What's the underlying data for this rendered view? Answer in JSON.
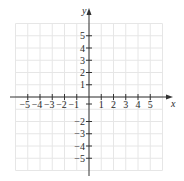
{
  "chart_data": {
    "type": "scatter",
    "title": "",
    "xlabel": "x",
    "ylabel": "y",
    "xlim": [
      -6,
      6
    ],
    "ylim": [
      -6,
      6
    ],
    "grid": true,
    "x_ticks": [
      -5,
      -4,
      -3,
      -2,
      -1,
      1,
      2,
      3,
      4,
      5
    ],
    "y_ticks": [
      5,
      4,
      3,
      2,
      1,
      -2,
      -3,
      -4,
      -5
    ],
    "x_tick_labels": [
      "−5",
      "−4",
      "−3",
      "−2",
      "−1",
      "1",
      "2",
      "3",
      "4",
      "5"
    ],
    "y_tick_labels": [
      "5",
      "4",
      "3",
      "2",
      "1",
      "−2",
      "−3",
      "−4",
      "−5"
    ],
    "series": [],
    "colors": {
      "axis": "#333333",
      "grid": "#e6e6e6",
      "text": "#2a2a2a",
      "background": "#ffffff"
    }
  }
}
